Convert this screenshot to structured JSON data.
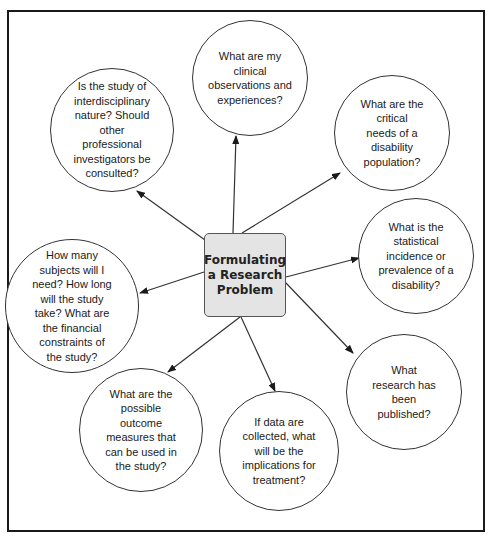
{
  "diagram": {
    "center": {
      "label": "Formulating\na Research\nProblem",
      "fill": "#e4e4e4"
    },
    "nodes": [
      {
        "id": "clinical-observations",
        "text": "What are my clinical\nobservations and\nexperiences?"
      },
      {
        "id": "critical-needs",
        "text": "What are the critical\nneeds of a disability\npopulation?"
      },
      {
        "id": "statistical-incidence",
        "text": "What is the\nstatistical\nincidence or\nprevalence of a\ndisability?"
      },
      {
        "id": "research-published",
        "text": "What\nresearch has\nbeen\npublished?"
      },
      {
        "id": "implications-treatment",
        "text": "If data are\ncollected, what\nwill be the\nimplications for\ntreatment?"
      },
      {
        "id": "outcome-measures",
        "text": "What are the\npossible\noutcome\nmeasures that\ncan be used in\nthe study?"
      },
      {
        "id": "subjects-time-cost",
        "text": "How many\nsubjects will I\nneed? How long\nwill the study\ntake? What are\nthe financial\nconstraints of\nthe study?"
      },
      {
        "id": "interdisciplinary",
        "text": "Is the study of\ninterdisciplinary\nnature? Should\nother\nprofessional\ninvestigators be\nconsulted?"
      }
    ],
    "edges_direction": "center-to-node",
    "line_color": "#333333",
    "frame_color": "#1a1a1a"
  }
}
